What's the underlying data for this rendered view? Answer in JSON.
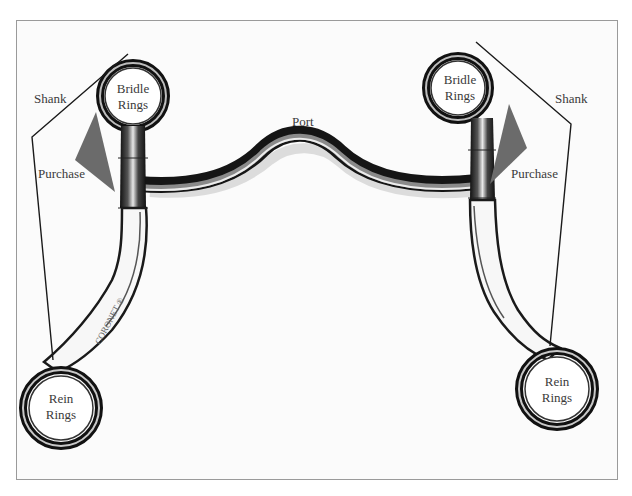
{
  "diagram": {
    "labels": {
      "shank_left": "Shank",
      "shank_right": "Shank",
      "purchase_left": "Purchase",
      "purchase_right": "Purchase",
      "bridle_rings_left": [
        "Bridle",
        "Rings"
      ],
      "bridle_rings_right": [
        "Bridle",
        "Rings"
      ],
      "port": "Port",
      "rein_rings_left": [
        "Rein",
        "Rings"
      ],
      "rein_rings_right": [
        "Rein",
        "Rings"
      ]
    },
    "engraving": "CORONET ®",
    "colors": {
      "frame_border": "#9a9a9a",
      "background": "#fbfbfb",
      "purchase_triangle": "#6b6b6b",
      "leader_line": "#1a1a1a",
      "metal_dark": "#1e1e1e",
      "metal_light": "#d9d9d9",
      "label_text": "#3a3a3a"
    }
  }
}
